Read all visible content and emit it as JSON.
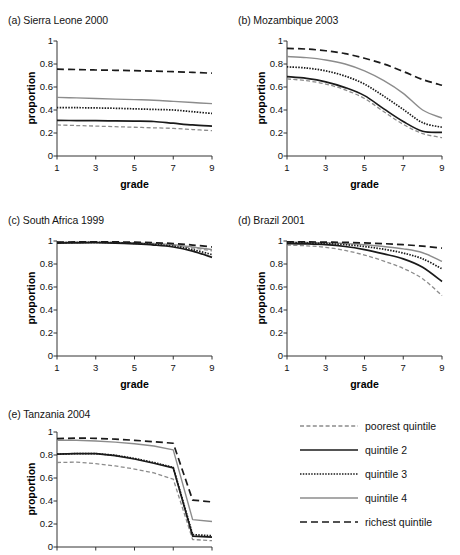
{
  "figure": {
    "axis_label_y": "proportion",
    "axis_label_x": "grade",
    "y_ticks": [
      "0",
      "0.2",
      "0.4",
      "0.6",
      "0.8",
      "1"
    ],
    "x_ticks": [
      "1",
      "3",
      "5",
      "7",
      "9"
    ],
    "line_color_dark": "#1a1a1a",
    "line_color_gray": "#8c8c8c"
  },
  "legend": {
    "items": [
      {
        "label": "poorest quintile",
        "style": "short-dash-gray",
        "color": "#8c8c8c"
      },
      {
        "label": "quintile 2",
        "style": "solid-dark",
        "color": "#1a1a1a"
      },
      {
        "label": "quintile 3",
        "style": "dotted-dark",
        "color": "#1a1a1a"
      },
      {
        "label": "quintile 4",
        "style": "solid-gray",
        "color": "#8c8c8c"
      },
      {
        "label": "richest quintile",
        "style": "long-dash-dark",
        "color": "#1a1a1a"
      }
    ]
  },
  "chart_data": {
    "type": "line",
    "xlabel": "grade",
    "ylabel": "proportion",
    "xlim": [
      1,
      9
    ],
    "ylim": [
      0,
      1
    ],
    "grid": false,
    "legend_position": "bottom-right",
    "x": [
      1,
      2,
      3,
      4,
      5,
      6,
      7,
      8,
      9
    ],
    "panels": [
      {
        "key": "a",
        "title": "(a) Sierra Leone 2000",
        "has_x_ticks": true,
        "series": [
          {
            "name": "poorest quintile",
            "values": [
              0.27,
              0.265,
              0.26,
              0.255,
              0.25,
              0.245,
              0.24,
              0.23,
              0.22
            ]
          },
          {
            "name": "quintile 2",
            "values": [
              0.31,
              0.308,
              0.307,
              0.305,
              0.303,
              0.3,
              0.285,
              0.27,
              0.26
            ]
          },
          {
            "name": "quintile 3",
            "values": [
              0.42,
              0.42,
              0.418,
              0.415,
              0.41,
              0.405,
              0.4,
              0.385,
              0.37
            ]
          },
          {
            "name": "quintile 4",
            "values": [
              0.51,
              0.505,
              0.5,
              0.495,
              0.49,
              0.485,
              0.475,
              0.465,
              0.455
            ]
          },
          {
            "name": "richest quintile",
            "values": [
              0.755,
              0.752,
              0.748,
              0.745,
              0.742,
              0.738,
              0.733,
              0.727,
              0.72
            ]
          }
        ]
      },
      {
        "key": "b",
        "title": "(b) Mozambique 2003",
        "has_x_ticks": true,
        "series": [
          {
            "name": "poorest quintile",
            "values": [
              0.67,
              0.655,
              0.625,
              0.575,
              0.5,
              0.385,
              0.275,
              0.195,
              0.16
            ]
          },
          {
            "name": "quintile 2",
            "values": [
              0.69,
              0.675,
              0.645,
              0.595,
              0.525,
              0.41,
              0.3,
              0.215,
              0.205
            ]
          },
          {
            "name": "quintile 3",
            "values": [
              0.775,
              0.765,
              0.74,
              0.695,
              0.625,
              0.52,
              0.405,
              0.29,
              0.25
            ]
          },
          {
            "name": "quintile 4",
            "values": [
              0.865,
              0.855,
              0.835,
              0.8,
              0.74,
              0.655,
              0.545,
              0.4,
              0.33
            ]
          },
          {
            "name": "richest quintile",
            "values": [
              0.935,
              0.93,
              0.915,
              0.89,
              0.85,
              0.8,
              0.735,
              0.665,
              0.615
            ]
          }
        ]
      },
      {
        "key": "c",
        "title": "(c) South Africa 1999",
        "has_x_ticks": true,
        "series": [
          {
            "name": "poorest quintile",
            "values": [
              0.985,
              0.987,
              0.988,
              0.985,
              0.98,
              0.972,
              0.962,
              0.94,
              0.915
            ]
          },
          {
            "name": "quintile 2",
            "values": [
              0.982,
              0.984,
              0.985,
              0.982,
              0.975,
              0.965,
              0.948,
              0.912,
              0.858
            ]
          },
          {
            "name": "quintile 3",
            "values": [
              0.985,
              0.987,
              0.988,
              0.986,
              0.98,
              0.97,
              0.955,
              0.925,
              0.882
            ]
          },
          {
            "name": "quintile 4",
            "values": [
              0.988,
              0.99,
              0.99,
              0.988,
              0.984,
              0.978,
              0.968,
              0.948,
              0.925
            ]
          },
          {
            "name": "richest quintile",
            "values": [
              0.99,
              0.992,
              0.993,
              0.992,
              0.99,
              0.985,
              0.978,
              0.965,
              0.948
            ]
          }
        ]
      },
      {
        "key": "d",
        "title": "(d) Brazil 2001",
        "has_x_ticks": true,
        "series": [
          {
            "name": "poorest quintile",
            "values": [
              0.965,
              0.958,
              0.945,
              0.918,
              0.878,
              0.825,
              0.762,
              0.672,
              0.525
            ]
          },
          {
            "name": "quintile 2",
            "values": [
              0.978,
              0.975,
              0.968,
              0.952,
              0.925,
              0.888,
              0.845,
              0.772,
              0.648
            ]
          },
          {
            "name": "quintile 3",
            "values": [
              0.985,
              0.983,
              0.978,
              0.968,
              0.952,
              0.928,
              0.895,
              0.845,
              0.758
            ]
          },
          {
            "name": "quintile 4",
            "values": [
              0.99,
              0.988,
              0.985,
              0.978,
              0.968,
              0.952,
              0.932,
              0.898,
              0.822
            ]
          },
          {
            "name": "richest quintile",
            "values": [
              0.992,
              0.992,
              0.99,
              0.988,
              0.983,
              0.977,
              0.968,
              0.955,
              0.938
            ]
          }
        ]
      },
      {
        "key": "e",
        "title": "(e) Tanzania 2004",
        "has_x_ticks": false,
        "series": [
          {
            "name": "poorest quintile",
            "values": [
              0.735,
              0.738,
              0.725,
              0.705,
              0.678,
              0.645,
              0.59,
              0.065,
              0.055
            ]
          },
          {
            "name": "quintile 2",
            "values": [
              0.808,
              0.812,
              0.812,
              0.795,
              0.765,
              0.728,
              0.688,
              0.095,
              0.085
            ]
          },
          {
            "name": "quintile 3",
            "values": [
              0.808,
              0.812,
              0.812,
              0.798,
              0.77,
              0.735,
              0.692,
              0.108,
              0.098
            ]
          },
          {
            "name": "quintile 4",
            "values": [
              0.928,
              0.928,
              0.922,
              0.912,
              0.898,
              0.878,
              0.845,
              0.238,
              0.222
            ]
          },
          {
            "name": "richest quintile",
            "values": [
              0.942,
              0.948,
              0.945,
              0.938,
              0.928,
              0.915,
              0.902,
              0.408,
              0.392
            ]
          }
        ]
      }
    ]
  }
}
